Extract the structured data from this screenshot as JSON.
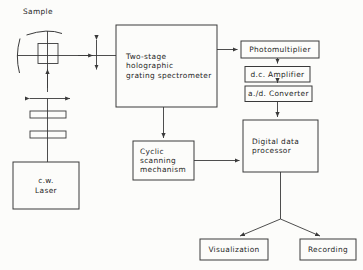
{
  "figure": {
    "kind": "block-diagram",
    "line_color": "#3a3a3a",
    "text_color": "#252525",
    "background": "#fcfcfa"
  },
  "labels": {
    "sample": "Sample"
  },
  "boxes": {
    "spectrometer": "Two-stage holographic\ngrating spectrometer",
    "photomultiplier": "Photomultiplier",
    "dc_amplifier": "d.c. Amplifier",
    "ad_converter": "a./d. Converter",
    "digital_data_processor": "Digital data\nprocessor",
    "cyclic_scanning": "Cyclic\nscanning\nmechanism",
    "cw_laser": "c.w.\nLaser",
    "visualization": "Visualization",
    "recording": "Recording"
  },
  "optics": {
    "sample_cell_name": "sample-cell",
    "collection_mirror_name": "curved-collection-mirror",
    "side_mirror_name": "curved-side-mirror",
    "lens_1_name": "focusing-lens-upper",
    "lens_2_name": "focusing-lens-lower"
  },
  "connections": [
    "sample-to-spectrometer",
    "spectrometer-to-photomultiplier",
    "photomultiplier-to-dc-amplifier",
    "dc-amplifier-to-ad-converter",
    "ad-converter-to-digital-data-processor",
    "spectrometer-to-cyclic-scanning",
    "cyclic-scanning-to-digital-data-processor",
    "digital-data-processor-to-visualization",
    "digital-data-processor-to-recording",
    "cw-laser-to-sample"
  ]
}
